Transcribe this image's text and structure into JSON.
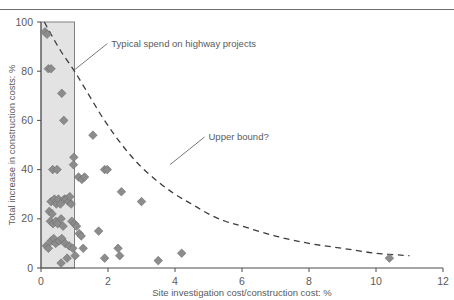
{
  "figure": {
    "background_color": "#ffffff",
    "rule_color": "#6e6e6e"
  },
  "chart_data": {
    "type": "scatter",
    "title": "",
    "xlabel": "Site investigation cost/construction cost: %",
    "ylabel": "Total increase in construction costs: %",
    "xlim": [
      0,
      12
    ],
    "ylim": [
      0,
      100
    ],
    "xticks": [
      0,
      2,
      4,
      6,
      8,
      10,
      12
    ],
    "yticks": [
      0,
      20,
      40,
      60,
      80,
      100
    ],
    "xtick_labels": [
      "0",
      "2",
      "4",
      "6",
      "8",
      "10",
      "12"
    ],
    "ytick_labels": [
      "0",
      "20",
      "40",
      "60",
      "80",
      "100"
    ],
    "grid": false,
    "legend": null,
    "marker": {
      "shape": "diamond",
      "color": "#8c8c8c",
      "edge_color": "#6f6f6f",
      "size": 6
    },
    "points": [
      [
        0.12,
        96
      ],
      [
        0.18,
        95
      ],
      [
        0.22,
        81
      ],
      [
        0.3,
        81
      ],
      [
        0.62,
        71
      ],
      [
        0.68,
        60
      ],
      [
        1.55,
        54
      ],
      [
        0.98,
        45
      ],
      [
        0.97,
        42
      ],
      [
        1.9,
        40
      ],
      [
        1.98,
        40
      ],
      [
        0.35,
        40
      ],
      [
        0.48,
        40
      ],
      [
        1.12,
        37
      ],
      [
        1.22,
        36
      ],
      [
        1.3,
        37
      ],
      [
        2.4,
        31
      ],
      [
        3.0,
        27
      ],
      [
        0.3,
        27
      ],
      [
        0.4,
        28
      ],
      [
        0.46,
        26
      ],
      [
        0.52,
        28
      ],
      [
        0.58,
        26
      ],
      [
        0.7,
        28
      ],
      [
        0.76,
        28
      ],
      [
        0.82,
        27
      ],
      [
        0.86,
        29
      ],
      [
        0.9,
        26
      ],
      [
        0.25,
        23
      ],
      [
        0.33,
        22
      ],
      [
        0.28,
        19
      ],
      [
        0.36,
        18
      ],
      [
        0.44,
        19
      ],
      [
        0.5,
        18
      ],
      [
        0.6,
        20
      ],
      [
        0.66,
        17
      ],
      [
        0.92,
        19
      ],
      [
        1.0,
        18
      ],
      [
        1.06,
        17
      ],
      [
        1.14,
        14
      ],
      [
        1.2,
        13
      ],
      [
        1.72,
        15
      ],
      [
        0.3,
        11
      ],
      [
        0.38,
        12
      ],
      [
        0.44,
        10
      ],
      [
        0.54,
        11
      ],
      [
        0.62,
        12
      ],
      [
        0.72,
        10
      ],
      [
        0.16,
        9
      ],
      [
        0.22,
        8
      ],
      [
        0.84,
        9
      ],
      [
        0.95,
        8
      ],
      [
        1.26,
        8
      ],
      [
        2.3,
        8
      ],
      [
        0.78,
        4
      ],
      [
        1.02,
        5
      ],
      [
        1.9,
        4
      ],
      [
        2.35,
        5
      ],
      [
        0.6,
        2
      ],
      [
        3.5,
        3
      ],
      [
        4.2,
        6
      ],
      [
        10.4,
        4
      ]
    ],
    "shaded_band": {
      "label": "Typical spend on highway projects",
      "x_start": 0.0,
      "x_end": 1.0,
      "y_start": 0,
      "y_end": 100,
      "fill_color": "#e3e3e3",
      "edge_color": "#808080"
    },
    "curve": {
      "label": "Upper bound?",
      "style": "dashed",
      "color": "#3d3d3d",
      "points": [
        [
          0.1,
          100
        ],
        [
          0.3,
          95
        ],
        [
          0.6,
          88
        ],
        [
          1.0,
          80
        ],
        [
          1.4,
          71
        ],
        [
          1.8,
          62
        ],
        [
          2.2,
          54
        ],
        [
          2.6,
          47
        ],
        [
          3.0,
          41
        ],
        [
          3.5,
          35
        ],
        [
          4.0,
          30
        ],
        [
          4.5,
          26
        ],
        [
          5.0,
          22
        ],
        [
          5.5,
          19
        ],
        [
          6.0,
          17
        ],
        [
          7.0,
          13
        ],
        [
          8.0,
          10
        ],
        [
          9.0,
          8
        ],
        [
          10.0,
          6
        ],
        [
          11.0,
          5
        ]
      ]
    },
    "annotations": [
      {
        "name": "typical-spend",
        "text": "Typical spend on highway projects",
        "text_x": 2.1,
        "text_y": 90,
        "anchor_x": 0.95,
        "anchor_y": 80
      },
      {
        "name": "upper-bound",
        "text": "Upper bound?",
        "text_x": 5.0,
        "text_y": 52,
        "anchor_x": 3.85,
        "anchor_y": 42
      }
    ]
  }
}
